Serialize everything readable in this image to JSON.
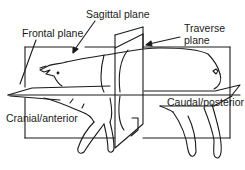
{
  "figure": {
    "colors": {
      "line": "#1a1a1a",
      "background": "#ffffff"
    },
    "labels": {
      "sagittal": "Sagittal plane",
      "frontal": "Frontal plane",
      "traverse_line1": "Traverse",
      "traverse_line2": "plane",
      "cranial": "Cranial/anterior",
      "caudal": "Caudal/posterior"
    }
  }
}
